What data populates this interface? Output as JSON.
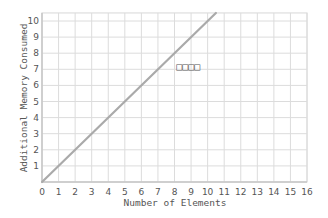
{
  "chart_data": {
    "type": "line",
    "title": "",
    "xlabel": "Number of Elements",
    "ylabel": "Additional Memory Consumed",
    "xlim": [
      0,
      16
    ],
    "ylim": [
      0,
      10.5
    ],
    "x_ticks": [
      "0",
      "1",
      "2",
      "3",
      "4",
      "5",
      "6",
      "7",
      "8",
      "9",
      "10",
      "11",
      "12",
      "13",
      "14",
      "15",
      "16"
    ],
    "y_ticks": [
      "1",
      "2",
      "3",
      "4",
      "5",
      "6",
      "7",
      "8",
      "9",
      "10"
    ],
    "grid": true,
    "legend": null,
    "series": [
      {
        "name": "linear",
        "color": "#aaaaaa",
        "x": [
          0,
          10.5
        ],
        "y": [
          0,
          10.5
        ]
      }
    ],
    "annotations": [
      {
        "text": "□□□□",
        "x": 8.1,
        "y": 7.2
      }
    ]
  }
}
